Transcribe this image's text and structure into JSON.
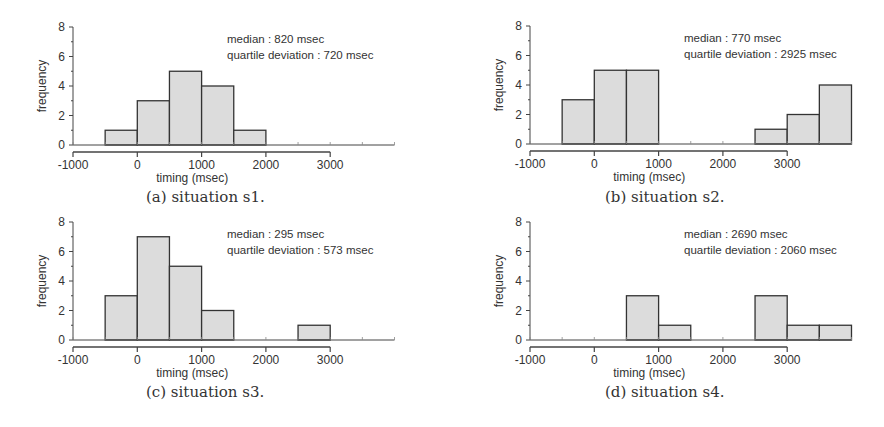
{
  "chart_data": [
    {
      "id": "a",
      "type": "bar",
      "subtype": "histogram",
      "caption": "(a) situation s1.",
      "xlabel": "timing (msec)",
      "ylabel": "frequency",
      "xlim": [
        -1000,
        4000
      ],
      "ylim": [
        0,
        8
      ],
      "xticks": [
        -1000,
        0,
        1000,
        2000,
        3000
      ],
      "yticks": [
        0,
        2,
        4,
        6,
        8
      ],
      "grid": false,
      "annotations": [
        "median : 820 msec",
        "quartile deviation : 720 msec"
      ],
      "bin_width": 500,
      "bins": [
        {
          "start": -500,
          "end": 0,
          "count": 1
        },
        {
          "start": 0,
          "end": 500,
          "count": 3
        },
        {
          "start": 500,
          "end": 1000,
          "count": 5
        },
        {
          "start": 1000,
          "end": 1500,
          "count": 4
        },
        {
          "start": 1500,
          "end": 2000,
          "count": 1
        }
      ]
    },
    {
      "id": "b",
      "type": "bar",
      "subtype": "histogram",
      "caption": "(b) situation s2.",
      "xlabel": "timing (msec)",
      "ylabel": "frequency",
      "xlim": [
        -1000,
        4000
      ],
      "ylim": [
        0,
        8
      ],
      "xticks": [
        -1000,
        0,
        1000,
        2000,
        3000
      ],
      "yticks": [
        0,
        2,
        4,
        6,
        8
      ],
      "grid": false,
      "annotations": [
        "median : 770 msec",
        "quartile deviation : 2925 msec"
      ],
      "bin_width": 500,
      "bins": [
        {
          "start": -500,
          "end": 0,
          "count": 3
        },
        {
          "start": 0,
          "end": 500,
          "count": 5
        },
        {
          "start": 500,
          "end": 1000,
          "count": 5
        },
        {
          "start": 2500,
          "end": 3000,
          "count": 1
        },
        {
          "start": 3000,
          "end": 3500,
          "count": 2
        },
        {
          "start": 3500,
          "end": 4000,
          "count": 4
        }
      ]
    },
    {
      "id": "c",
      "type": "bar",
      "subtype": "histogram",
      "caption": "(c) situation s3.",
      "xlabel": "timing (msec)",
      "ylabel": "frequency",
      "xlim": [
        -1000,
        4000
      ],
      "ylim": [
        0,
        8
      ],
      "xticks": [
        -1000,
        0,
        1000,
        2000,
        3000
      ],
      "yticks": [
        0,
        2,
        4,
        6,
        8
      ],
      "grid": false,
      "annotations": [
        "median : 295 msec",
        "quartile deviation : 573 msec"
      ],
      "bin_width": 500,
      "bins": [
        {
          "start": -500,
          "end": 0,
          "count": 3
        },
        {
          "start": 0,
          "end": 500,
          "count": 7
        },
        {
          "start": 500,
          "end": 1000,
          "count": 5
        },
        {
          "start": 1000,
          "end": 1500,
          "count": 2
        },
        {
          "start": 2500,
          "end": 3000,
          "count": 1
        }
      ]
    },
    {
      "id": "d",
      "type": "bar",
      "subtype": "histogram",
      "caption": "(d) situation s4.",
      "xlabel": "timing (msec)",
      "ylabel": "frequency",
      "xlim": [
        -1000,
        4000
      ],
      "ylim": [
        0,
        8
      ],
      "xticks": [
        -1000,
        0,
        1000,
        2000,
        3000
      ],
      "yticks": [
        0,
        2,
        4,
        6,
        8
      ],
      "grid": false,
      "annotations": [
        "median : 2690 msec",
        "quartile deviation : 2060 msec"
      ],
      "bin_width": 500,
      "bins": [
        {
          "start": 500,
          "end": 1000,
          "count": 3
        },
        {
          "start": 1000,
          "end": 1500,
          "count": 1
        },
        {
          "start": 2500,
          "end": 3000,
          "count": 3
        },
        {
          "start": 3000,
          "end": 3500,
          "count": 1
        },
        {
          "start": 3500,
          "end": 4000,
          "count": 1
        }
      ]
    }
  ],
  "style": {
    "bar_fill": "#dcdcdc",
    "bar_stroke": "#333333",
    "axis_color": "#444444",
    "text_color": "#333333"
  }
}
